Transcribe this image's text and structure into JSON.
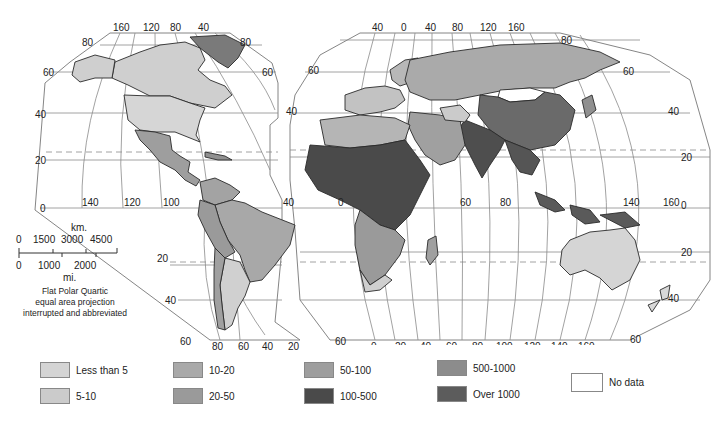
{
  "map": {
    "projection_note": [
      "Flat Polar Quartic",
      "equal area projection",
      "interrupted and abbreviated"
    ],
    "scale": {
      "km_label": "km.",
      "km_ticks": [
        "0",
        "1500",
        "3000",
        "4500"
      ],
      "mi_ticks": [
        "0",
        "1000",
        "2000"
      ],
      "mi_label": "mi."
    },
    "americas_lon_top": [
      "160",
      "120",
      "80",
      "40"
    ],
    "americas_lat_left": [
      "80",
      "60",
      "40",
      "20",
      "0",
      "20",
      "40",
      "60"
    ],
    "americas_lat_right": [
      "80",
      "60",
      "40"
    ],
    "americas_lon_equator": [
      "140",
      "120",
      "100",
      "40"
    ],
    "americas_lon_bottom": [
      "80",
      "60",
      "40",
      "20"
    ],
    "eurasia_lon_top": [
      "40",
      "0",
      "40",
      "80",
      "120",
      "160"
    ],
    "eurasia_lat_right": [
      "80",
      "60",
      "40",
      "20",
      "0",
      "20",
      "40",
      "60"
    ],
    "eurasia_lat_left": [
      "60",
      "40"
    ],
    "eurasia_lon_equator": [
      "0",
      "60",
      "80",
      "140",
      "160"
    ],
    "eurasia_lon_bottom": [
      "60",
      "0",
      "20",
      "40",
      "60",
      "80",
      "100",
      "120",
      "140",
      "160"
    ]
  },
  "legend": {
    "items": [
      {
        "label": "Less than 5",
        "color": "#d4d4d4"
      },
      {
        "label": "5-10",
        "color": "#cbcbcb"
      },
      {
        "label": "10-20",
        "color": "#a9a9a9"
      },
      {
        "label": "20-50",
        "color": "#9a9a9a"
      },
      {
        "label": "50-100",
        "color": "#9e9e9e"
      },
      {
        "label": "100-500",
        "color": "#4a4a4a"
      },
      {
        "label": "500-1000",
        "color": "#8c8c8c"
      },
      {
        "label": "Over 1000",
        "color": "#5c5c5c"
      },
      {
        "label": "No data",
        "color": "#ffffff"
      }
    ]
  }
}
